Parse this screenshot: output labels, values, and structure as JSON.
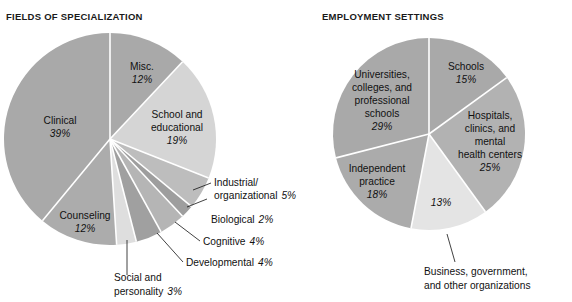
{
  "charts": [
    {
      "id": "fields-of-specialization",
      "title": "FIELDS OF SPECIALIZATION",
      "slices": [
        {
          "label": "Misc.",
          "pct": "12%",
          "value": 12,
          "color": "#a9a9a9",
          "placement": "inside"
        },
        {
          "label": "School and educational",
          "pct": "19%",
          "value": 19,
          "color": "#d5d5d5",
          "placement": "inside"
        },
        {
          "label": "Industrial/ organizational",
          "pct": "5%",
          "value": 5,
          "color": "#bdbdbd",
          "placement": "callout"
        },
        {
          "label": "Biological",
          "pct": "2%",
          "value": 2,
          "color": "#9e9e9e",
          "placement": "callout"
        },
        {
          "label": "Cognitive",
          "pct": "4%",
          "value": 4,
          "color": "#b5b5b5",
          "placement": "callout"
        },
        {
          "label": "Developmental",
          "pct": "4%",
          "value": 4,
          "color": "#a0a0a0",
          "placement": "callout"
        },
        {
          "label": "Social and personality",
          "pct": "3%",
          "value": 3,
          "color": "#dedede",
          "placement": "callout"
        },
        {
          "label": "Counseling",
          "pct": "12%",
          "value": 12,
          "color": "#acacac",
          "placement": "inside"
        },
        {
          "label": "Clinical",
          "pct": "39%",
          "value": 39,
          "color": "#a9a9a9",
          "placement": "inside"
        }
      ]
    },
    {
      "id": "employment-settings",
      "title": "EMPLOYMENT SETTINGS",
      "slices": [
        {
          "label": "Schools",
          "pct": "15%",
          "value": 15,
          "color": "#a9a9a9",
          "placement": "inside"
        },
        {
          "label": "Hospitals, clinics, and mental health centers",
          "pct": "25%",
          "value": 25,
          "color": "#b2b2b2",
          "placement": "inside"
        },
        {
          "label": "Business, government, and other organizations",
          "pct": "13%",
          "value": 13,
          "color": "#e4e4e4",
          "placement": "callout"
        },
        {
          "label": "Independent practice",
          "pct": "18%",
          "value": 18,
          "color": "#ababab",
          "placement": "inside"
        },
        {
          "label": "Universities, colleges, and professional schools",
          "pct": "29%",
          "value": 29,
          "color": "#a9a9a9",
          "placement": "inside"
        }
      ]
    }
  ],
  "chart_data": [
    {
      "type": "pie",
      "title": "FIELDS OF SPECIALIZATION",
      "categories": [
        "Misc.",
        "School and educational",
        "Industrial/organizational",
        "Biological",
        "Cognitive",
        "Developmental",
        "Social and personality",
        "Counseling",
        "Clinical"
      ],
      "values": [
        12,
        19,
        5,
        2,
        4,
        4,
        3,
        12,
        39
      ],
      "unit": "percent",
      "start_angle_deg": 0,
      "direction": "clockwise",
      "legend": "none",
      "labels_on_slices": true
    },
    {
      "type": "pie",
      "title": "EMPLOYMENT SETTINGS",
      "categories": [
        "Schools",
        "Hospitals, clinics, and mental health centers",
        "Business, government, and other organizations",
        "Independent practice",
        "Universities, colleges, and professional schools"
      ],
      "values": [
        15,
        25,
        13,
        18,
        29
      ],
      "unit": "percent",
      "start_angle_deg": 0,
      "direction": "clockwise",
      "legend": "none",
      "labels_on_slices": true
    }
  ],
  "left_labels": {
    "misc_l1": "Misc.",
    "misc_pct": "12%",
    "school_l1": "School and",
    "school_l2": "educational",
    "school_pct": "19%",
    "clinical_l1": "Clinical",
    "clinical_pct": "39%",
    "counseling_l1": "Counseling",
    "counseling_pct": "12%",
    "io_l1": "Industrial/",
    "io_l2": "organizational",
    "io_pct": "5%",
    "bio_l1": "Biological",
    "bio_pct": "2%",
    "cog_l1": "Cognitive",
    "cog_pct": "4%",
    "dev_l1": "Developmental",
    "dev_pct": "4%",
    "soc_l1": "Social and",
    "soc_l2": "personality",
    "soc_pct": "3%"
  },
  "right_labels": {
    "schools_l1": "Schools",
    "schools_pct": "15%",
    "hosp_l1": "Hospitals,",
    "hosp_l2": "clinics, and",
    "hosp_l3": "mental",
    "hosp_l4": "health centers",
    "hosp_pct": "25%",
    "univ_l1": "Universities,",
    "univ_l2": "colleges, and",
    "univ_l3": "professional",
    "univ_l4": "schools",
    "univ_pct": "29%",
    "indep_l1": "Independent",
    "indep_l2": "practice",
    "indep_pct": "18%",
    "biz_pct": "13%",
    "biz_l1": "Business, government,",
    "biz_l2": "and other organizations"
  }
}
